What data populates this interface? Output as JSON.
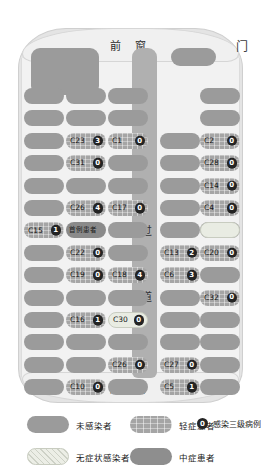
{
  "diagram": {
    "front_window_label": "前 窗",
    "rear_window_label": "后 窗",
    "door_label": "门",
    "aisle_label_top": "过",
    "aisle_label_bottom": "道",
    "index_case_label": "首例患者"
  },
  "colors": {
    "uninfected": "#9b9b9b",
    "mild": "#a5a5a5",
    "moderate": "#8e8e8e",
    "asymptomatic": "#e9ece3",
    "count_badge": "#242424",
    "aisle": "#b0b0b0",
    "bus_body": "#e4e4e4",
    "cabin": "#f2f2f2"
  },
  "seats": [
    {
      "id": "C23",
      "count": "3",
      "status": "mild",
      "col": 1,
      "row": 2
    },
    {
      "id": "C1",
      "count": "0",
      "status": "mild",
      "col": 2,
      "row": 2
    },
    {
      "id": "C31",
      "count": "0",
      "status": "mild",
      "col": 1,
      "row": 3
    },
    {
      "id": "C26",
      "count": "4",
      "status": "mild",
      "col": 1,
      "row": 5
    },
    {
      "id": "C17",
      "count": "0",
      "status": "mild",
      "col": 2,
      "row": 5
    },
    {
      "id": "C15",
      "count": "1",
      "status": "mild",
      "col": 0,
      "row": 6
    },
    {
      "id": "首例患者",
      "count": "",
      "status": "index-case",
      "col": 1,
      "row": 6
    },
    {
      "id": "C22",
      "count": "0",
      "status": "mild",
      "col": 1,
      "row": 7
    },
    {
      "id": "C19",
      "count": "0",
      "status": "mild",
      "col": 1,
      "row": 8
    },
    {
      "id": "C18",
      "count": "4",
      "status": "mild",
      "col": 2,
      "row": 8
    },
    {
      "id": "C16",
      "count": "1",
      "status": "mild",
      "col": 1,
      "row": 10
    },
    {
      "id": "C30",
      "count": "0",
      "status": "asymptomatic",
      "col": 2,
      "row": 10
    },
    {
      "id": "C26b",
      "count": "0",
      "status": "mild",
      "col": 2,
      "row": 12
    },
    {
      "id": "C10",
      "count": "0",
      "status": "mild",
      "col": 1,
      "row": 13
    },
    {
      "id": "C2",
      "count": "0",
      "status": "mild",
      "col": 4,
      "row": 2
    },
    {
      "id": "C28",
      "count": "0",
      "status": "mild",
      "col": 4,
      "row": 3
    },
    {
      "id": "C14",
      "count": "0",
      "status": "mild",
      "col": 4,
      "row": 4
    },
    {
      "id": "C4",
      "count": "0",
      "status": "mild",
      "col": 4,
      "row": 5
    },
    {
      "id": "C13",
      "count": "2",
      "status": "mild",
      "col": 3,
      "row": 7
    },
    {
      "id": "C20",
      "count": "0",
      "status": "mild",
      "col": 4,
      "row": 7
    },
    {
      "id": "C6",
      "count": "3",
      "status": "mild",
      "col": 3,
      "row": 8
    },
    {
      "id": "C32",
      "count": "0",
      "status": "mild",
      "col": 4,
      "row": 9
    },
    {
      "id": "C27",
      "count": "0",
      "status": "mild",
      "col": 3,
      "row": 12
    },
    {
      "id": "C5",
      "count": "1",
      "status": "mild",
      "col": 3,
      "row": 13
    }
  ],
  "seat_display": {
    "C26b": "C26"
  },
  "legend": {
    "items": [
      {
        "name": "uninfected",
        "swatch": "uninfected",
        "label": "未感染者"
      },
      {
        "name": "mild",
        "swatch": "mild",
        "label": "轻症患者"
      },
      {
        "name": "tier3-count",
        "swatch": "dot",
        "label": "感染三级病例数",
        "badge": "0"
      },
      {
        "name": "asymptomatic",
        "swatch": "asymptomatic",
        "label": "无症状感染者"
      },
      {
        "name": "moderate",
        "swatch": "moderate",
        "label": "中症患者"
      }
    ]
  }
}
